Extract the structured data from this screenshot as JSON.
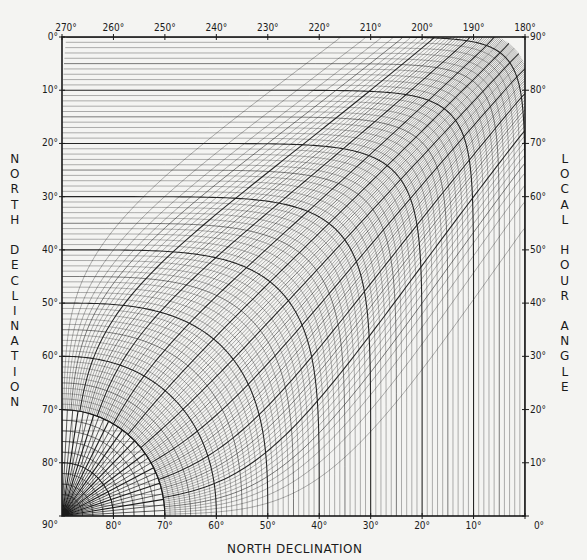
{
  "chart_data": {
    "type": "table",
    "subtype": "polar-coordinate nomogram grid (declination vs. local hour angle)",
    "title": "",
    "top_axis": {
      "label": "",
      "ticks": [
        "270°",
        "260°",
        "250°",
        "240°",
        "230°",
        "220°",
        "210°",
        "200°",
        "190°",
        "180°"
      ],
      "range": [
        270,
        180
      ]
    },
    "left_axis": {
      "label": "NORTH DECLINATION",
      "ticks": [
        "0°",
        "10°",
        "20°",
        "30°",
        "40°",
        "50°",
        "60°",
        "70°",
        "80°",
        "90°"
      ],
      "range": [
        0,
        90
      ]
    },
    "bottom_axis": {
      "label": "NORTH DECLINATION",
      "ticks": [
        "90°",
        "80°",
        "70°",
        "60°",
        "50°",
        "40°",
        "30°",
        "20°",
        "10°",
        "0°"
      ],
      "range": [
        90,
        0
      ]
    },
    "right_axis": {
      "label": "LOCAL HOUR ANGLE",
      "ticks": [
        "90°",
        "80°",
        "70°",
        "60°",
        "50°",
        "40°",
        "30°",
        "20°",
        "10°",
        "0°"
      ],
      "range": [
        90,
        0
      ]
    },
    "grid": {
      "major_every_deg": 10,
      "minor_every_deg": 2,
      "inner_polar_radius_deg": 20,
      "origin": "bottom-left (90°, 90°)"
    },
    "colors": {
      "ink": "#1a1a1a",
      "paper": "#f4f4f2"
    }
  },
  "labels": {
    "left_title": "NORTH DECLINATION",
    "right_title": "LOCAL HOUR ANGLE",
    "bottom_title": "NORTH DECLINATION"
  }
}
